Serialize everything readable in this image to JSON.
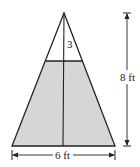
{
  "diagram": {
    "type": "triangular tank cross-section",
    "fill_color": "#d6d6d6",
    "stroke_color": "#222222",
    "labels": {
      "top_height": "3",
      "height": "8 ft",
      "base": "6 ft"
    }
  }
}
